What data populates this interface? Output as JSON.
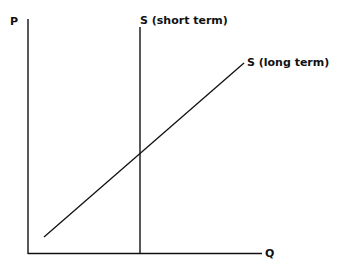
{
  "diagram": {
    "type": "supply curves",
    "axes": {
      "y_label": "P",
      "x_label": "Q"
    },
    "curves": [
      {
        "name": "short-term-supply",
        "label": "S (short term)",
        "shape": "vertical"
      },
      {
        "name": "long-term-supply",
        "label": "S (long term)",
        "shape": "upward sloping"
      }
    ],
    "colors": {
      "line": "#111111",
      "background": "#ffffff"
    }
  }
}
